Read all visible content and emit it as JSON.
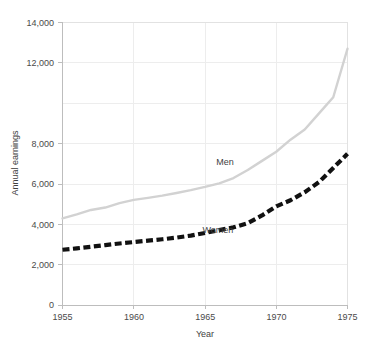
{
  "chart_data": {
    "type": "line",
    "title": "",
    "xlabel": "Year",
    "ylabel": "Annual earnings",
    "xlim": [
      1955,
      1975
    ],
    "ylim": [
      0,
      14000
    ],
    "grid": true,
    "legend_position": "inline-labels",
    "xticks": [
      "1955",
      "1960",
      "1965",
      "1970",
      "1975"
    ],
    "xtick_values": [
      1955,
      1960,
      1965,
      1970,
      1975
    ],
    "yticks": [
      "0",
      "2,000",
      "4,000",
      "6,000",
      "8,000",
      "12,000",
      "14,000"
    ],
    "ytick_values": [
      0,
      2000,
      4000,
      6000,
      8000,
      12000,
      14000
    ],
    "ygridline_values": [
      0,
      2000,
      4000,
      6000,
      8000,
      10000,
      12000,
      14000
    ],
    "x": [
      1955,
      1956,
      1957,
      1958,
      1959,
      1960,
      1961,
      1962,
      1963,
      1964,
      1965,
      1966,
      1967,
      1968,
      1969,
      1970,
      1971,
      1972,
      1973,
      1974,
      1975
    ],
    "series": [
      {
        "name": "Men",
        "label": "Men",
        "color": "#d2d2d2",
        "style": "solid",
        "width": 2.4,
        "label_x": 1966.4,
        "label_y": 6950,
        "values": [
          4300,
          4500,
          4720,
          4840,
          5060,
          5220,
          5320,
          5430,
          5560,
          5700,
          5860,
          6040,
          6300,
          6700,
          7150,
          7600,
          8200,
          8700,
          9500,
          10300,
          12700
        ]
      },
      {
        "name": "Women",
        "label": "Women",
        "color": "#111111",
        "style": "dashed",
        "width": 4.2,
        "dasharray": "7,3.5",
        "label_x": 1965.9,
        "label_y": 3570,
        "values": [
          2750,
          2820,
          2900,
          2980,
          3060,
          3130,
          3200,
          3270,
          3350,
          3450,
          3580,
          3720,
          3860,
          4070,
          4450,
          4900,
          5200,
          5600,
          6100,
          6800,
          7500
        ]
      }
    ],
    "series_detail": [
      {
        "name": "Men",
        "points": [
          {
            "year": 1955,
            "value": 4300
          },
          {
            "year": 1960,
            "value": 5220
          },
          {
            "year": 1965,
            "value": 5860
          },
          {
            "year": 1970,
            "value": 7600
          },
          {
            "year": 1975,
            "value": 12700
          }
        ]
      },
      {
        "name": "Women",
        "points": [
          {
            "year": 1955,
            "value": 2750
          },
          {
            "year": 1960,
            "value": 3130
          },
          {
            "year": 1965,
            "value": 3580
          },
          {
            "year": 1970,
            "value": 4900
          },
          {
            "year": 1975,
            "value": 7500
          }
        ]
      }
    ]
  },
  "labels": {
    "y_tick_14000": "14,000",
    "y_tick_12000": "12,000",
    "y_tick_8000": "8,000",
    "y_tick_6000": "6,000",
    "y_tick_4000": "4,000",
    "y_tick_2000": "2,000",
    "y_tick_0": "0",
    "x_tick_1955": "1955",
    "x_tick_1960": "1960",
    "x_tick_1965": "1965",
    "x_tick_1970": "1970",
    "x_tick_1975": "1975",
    "y_axis_title": "Annual earnings",
    "x_axis_title": "Year",
    "series_men": "Men",
    "series_women": "Women"
  },
  "colors": {
    "men_line": "#d2d2d2",
    "women_line": "#111111",
    "gridline": "#ededed",
    "axis": "#bdbdbd",
    "text": "#3f3f3f",
    "background": "#ffffff"
  }
}
